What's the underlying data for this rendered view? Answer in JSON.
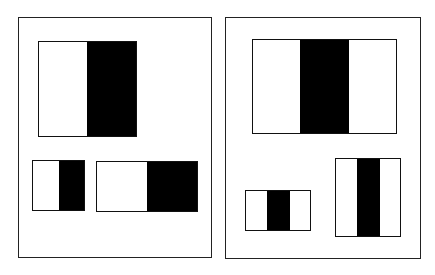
{
  "panels": [
    {
      "name": "edge-features",
      "features": [
        {
          "name": "two-rectangle-feature-large",
          "type": "edge-vertical",
          "black_side": "right"
        },
        {
          "name": "two-rectangle-feature-small",
          "type": "edge-vertical",
          "black_side": "right"
        },
        {
          "name": "two-rectangle-feature-wide",
          "type": "edge-vertical",
          "black_side": "right"
        }
      ]
    },
    {
      "name": "line-features",
      "features": [
        {
          "name": "three-rectangle-feature-large",
          "type": "line-vertical",
          "black_position": "center"
        },
        {
          "name": "three-rectangle-feature-small",
          "type": "line-vertical",
          "black_position": "center"
        },
        {
          "name": "three-rectangle-feature-tall",
          "type": "line-vertical",
          "black_position": "center"
        }
      ]
    }
  ],
  "colors": {
    "dark": "#000000",
    "light": "#ffffff",
    "border": "#222222"
  }
}
